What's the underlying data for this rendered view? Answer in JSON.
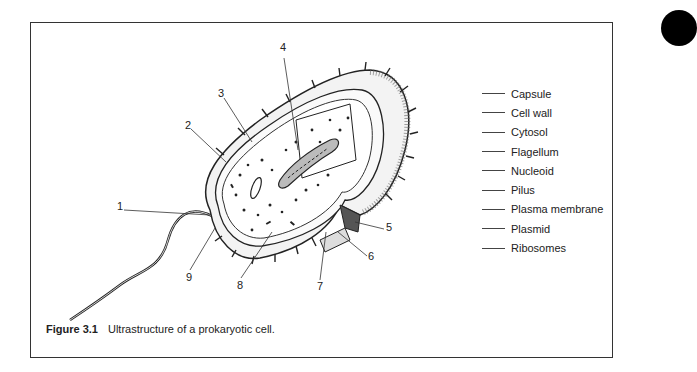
{
  "figure": {
    "label": "Figure 3.1",
    "caption": "Ultrastructure of a prokaryotic cell."
  },
  "callouts": [
    {
      "number": "1",
      "x": 117,
      "y": 206
    },
    {
      "number": "2",
      "x": 185,
      "y": 125
    },
    {
      "number": "3",
      "x": 218,
      "y": 93
    },
    {
      "number": "4",
      "x": 280,
      "y": 47
    },
    {
      "number": "5",
      "x": 386,
      "y": 225
    },
    {
      "number": "6",
      "x": 368,
      "y": 253
    },
    {
      "number": "7",
      "x": 317,
      "y": 283
    },
    {
      "number": "8",
      "x": 237,
      "y": 282
    },
    {
      "number": "9",
      "x": 186,
      "y": 274
    }
  ],
  "legend": {
    "items": [
      {
        "label": "Capsule"
      },
      {
        "label": "Cell wall"
      },
      {
        "label": "Cytosol"
      },
      {
        "label": "Flagellum"
      },
      {
        "label": "Nucleoid"
      },
      {
        "label": "Pilus"
      },
      {
        "label": "Plasma membrane"
      },
      {
        "label": "Plasmid"
      },
      {
        "label": "Ribosomes"
      }
    ]
  },
  "colors": {
    "border": "#333333",
    "ink": "#1a1a1a",
    "background": "#ffffff"
  }
}
